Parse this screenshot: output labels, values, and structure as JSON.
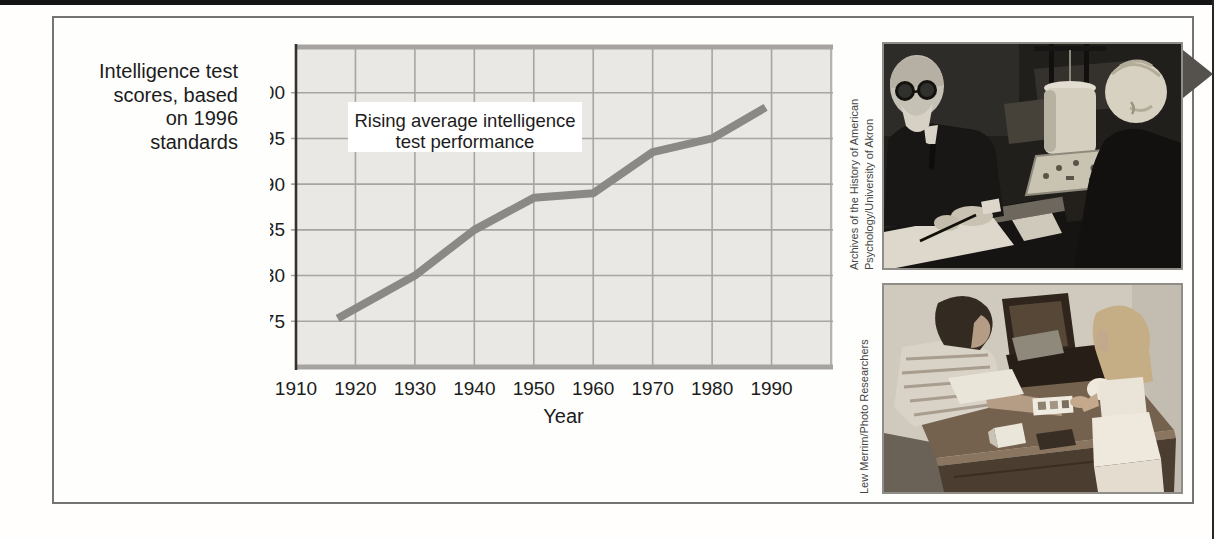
{
  "page": {
    "top_rule_color": "#141414",
    "right_rule_color": "#262626",
    "background": "#ffffff"
  },
  "figure": {
    "box_border_color": "#767472",
    "arrow_marker": {
      "icon": "right-triangle-arrow",
      "color": "#55524d"
    },
    "photos": [
      {
        "alt": "Black-and-white photograph: a bearded examiner writes notes while a boy works at a hanging form-board test apparatus",
        "credit_lines": [
          "Archives of the History of American",
          "Psychology/University of Akron"
        ]
      },
      {
        "alt": "Photograph: an examiner shows picture cards to a young girl standing at a wooden desk",
        "credit_lines": [
          "Lew Merrim/Photo Researchers",
          ""
        ]
      }
    ]
  },
  "chart_data": {
    "type": "line",
    "title_lines": [
      "Rising average intelligence",
      "test performance"
    ],
    "ylabel": "Intelligence test scores, based on 1996 standards",
    "ylabel_lines": [
      "Intelligence test",
      "scores, based",
      "on 1996",
      "standards"
    ],
    "xlabel": "Year",
    "x_ticks": [
      "1910",
      "1920",
      "1930",
      "1940",
      "1950",
      "1960",
      "1970",
      "1980",
      "1990"
    ],
    "y_ticks": [
      100,
      95,
      90,
      85,
      80,
      75
    ],
    "xlim": [
      1910,
      2000
    ],
    "ylim": [
      70,
      105
    ],
    "grid": true,
    "legend": "none",
    "series": [
      {
        "name": "Average intelligence test score (1996 standards)",
        "points": [
          [
            1917,
            75.3
          ],
          [
            1930,
            80
          ],
          [
            1940,
            85
          ],
          [
            1950,
            88.5
          ],
          [
            1960,
            89
          ],
          [
            1970,
            93.5
          ],
          [
            1980,
            95
          ],
          [
            1989,
            98.4
          ]
        ]
      }
    ],
    "colors": {
      "plot_bg": "#eae8e4",
      "gridline": "#a8a5a1",
      "edge_bar": "#a6a3a0",
      "line": "#8b8985",
      "axis": "#343230",
      "text": "#1c1c1c",
      "title_bg": "#ffffff"
    }
  }
}
